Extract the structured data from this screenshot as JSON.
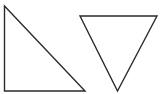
{
  "diagram": {
    "background": "#ffffff",
    "stroke_color": "#2a2a2a",
    "shapes": [
      {
        "id": "right-triangle",
        "type": "triangle",
        "kind": "right",
        "points": "4.5,6 4.5,91 85,91"
      },
      {
        "id": "inverted-triangle",
        "type": "triangle",
        "kind": "inverted-isosceles",
        "points": "80,16 157,16 117.5,91"
      }
    ]
  }
}
